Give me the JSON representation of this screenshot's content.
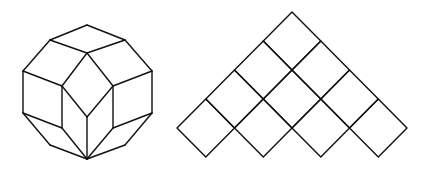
{
  "canvas": {
    "width": 427,
    "height": 170,
    "background": "#ffffff",
    "stroke": "#111111"
  },
  "figures": [
    {
      "name": "rhombic-dodecagon-tiling",
      "description": "Dodecagon dissected into rhombi (cube-like projection)",
      "segments": [
        [
          87,
          25,
          50,
          40
        ],
        [
          87,
          25,
          125,
          40
        ],
        [
          50,
          40,
          23,
          71
        ],
        [
          125,
          40,
          152,
          71
        ],
        [
          23,
          71,
          23,
          113
        ],
        [
          152,
          71,
          152,
          113
        ],
        [
          23,
          113,
          50,
          145
        ],
        [
          152,
          113,
          125,
          145
        ],
        [
          50,
          145,
          87,
          159
        ],
        [
          125,
          145,
          87,
          159
        ],
        [
          50,
          40,
          87,
          53
        ],
        [
          125,
          40,
          87,
          53
        ],
        [
          87,
          53,
          62,
          86
        ],
        [
          87,
          53,
          113,
          86
        ],
        [
          23,
          71,
          62,
          86
        ],
        [
          152,
          71,
          113,
          86
        ],
        [
          62,
          86,
          87,
          117
        ],
        [
          113,
          86,
          87,
          117
        ],
        [
          62,
          86,
          62,
          128
        ],
        [
          113,
          86,
          113,
          128
        ],
        [
          87,
          117,
          87,
          159
        ],
        [
          23,
          113,
          62,
          128
        ],
        [
          152,
          113,
          113,
          128
        ],
        [
          62,
          128,
          87,
          159
        ],
        [
          113,
          128,
          87,
          159
        ]
      ]
    },
    {
      "name": "square-pyramid-grid",
      "description": "Staircase triangle of 10 rotated squares (rows of 1,2,3,4)",
      "apex": [
        292,
        12
      ],
      "step_x": 28.75,
      "step_y": 29,
      "rows": 4
    }
  ]
}
